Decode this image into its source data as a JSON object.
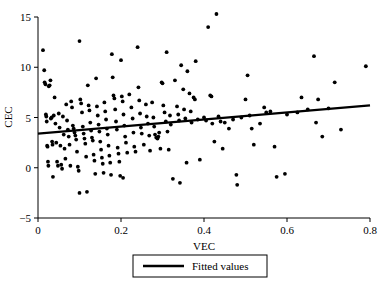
{
  "chart_data": {
    "type": "scatter",
    "title": "",
    "xlabel": "VEC",
    "ylabel": "CEC",
    "xlim": [
      0.0,
      0.8
    ],
    "ylim": [
      -5,
      15
    ],
    "xticks": [
      0,
      0.2,
      0.4,
      0.6,
      0.8
    ],
    "xtick_labels": [
      "0",
      "0.2",
      "0.4",
      "0.6",
      "0.8"
    ],
    "yticks": [
      -5,
      0,
      5,
      10,
      15
    ],
    "ytick_labels": [
      "−5",
      "0",
      "5",
      "10",
      "15"
    ],
    "grid": false,
    "legend_position": "below-axis-center",
    "legend_entries": [
      {
        "label": "Fitted values",
        "type": "line",
        "color": "#000000"
      }
    ],
    "series": [
      {
        "name": "CEC vs VEC observations",
        "type": "scatter",
        "marker": "circle",
        "color": "#000000",
        "points": [
          [
            0.012,
            11.7
          ],
          [
            0.015,
            9.7
          ],
          [
            0.016,
            8.5
          ],
          [
            0.018,
            8.3
          ],
          [
            0.019,
            5.3
          ],
          [
            0.02,
            5.1
          ],
          [
            0.021,
            4.6
          ],
          [
            0.022,
            2.2
          ],
          [
            0.023,
            2.1
          ],
          [
            0.024,
            0.6
          ],
          [
            0.025,
            0.2
          ],
          [
            0.026,
            8.1
          ],
          [
            0.028,
            8.2
          ],
          [
            0.03,
            8.7
          ],
          [
            0.031,
            4.9
          ],
          [
            0.033,
            5.0
          ],
          [
            0.034,
            2.6
          ],
          [
            0.035,
            2.3
          ],
          [
            0.036,
            -0.9
          ],
          [
            0.038,
            5.2
          ],
          [
            0.04,
            7.0
          ],
          [
            0.042,
            4.4
          ],
          [
            0.044,
            2.5
          ],
          [
            0.046,
            0.6
          ],
          [
            0.048,
            0.2
          ],
          [
            0.05,
            5.4
          ],
          [
            0.052,
            4.0
          ],
          [
            0.054,
            2.2
          ],
          [
            0.056,
            0.3
          ],
          [
            0.058,
            -0.1
          ],
          [
            0.06,
            5.1
          ],
          [
            0.062,
            3.3
          ],
          [
            0.064,
            1.9
          ],
          [
            0.066,
            0.9
          ],
          [
            0.068,
            6.3
          ],
          [
            0.07,
            4.7
          ],
          [
            0.072,
            3.8
          ],
          [
            0.074,
            3.1
          ],
          [
            0.076,
            2.3
          ],
          [
            0.078,
            0.2
          ],
          [
            0.08,
            6.6
          ],
          [
            0.082,
            6.0
          ],
          [
            0.084,
            4.2
          ],
          [
            0.086,
            3.9
          ],
          [
            0.088,
            3.5
          ],
          [
            0.09,
            3.2
          ],
          [
            0.092,
            2.8
          ],
          [
            0.094,
            1.6
          ],
          [
            0.096,
            0.1
          ],
          [
            0.098,
            -0.3
          ],
          [
            0.1,
            12.6
          ],
          [
            0.102,
            6.8
          ],
          [
            0.104,
            6.4
          ],
          [
            0.106,
            5.5
          ],
          [
            0.108,
            4.1
          ],
          [
            0.11,
            3.4
          ],
          [
            0.112,
            2.9
          ],
          [
            0.114,
            2.4
          ],
          [
            0.116,
            1.1
          ],
          [
            0.118,
            -2.4
          ],
          [
            0.1,
            -2.5
          ],
          [
            0.12,
            8.2
          ],
          [
            0.122,
            6.2
          ],
          [
            0.124,
            5.7
          ],
          [
            0.126,
            4.5
          ],
          [
            0.128,
            3.7
          ],
          [
            0.13,
            3.0
          ],
          [
            0.132,
            2.7
          ],
          [
            0.134,
            1.3
          ],
          [
            0.136,
            0.7
          ],
          [
            0.138,
            -0.6
          ],
          [
            0.14,
            8.9
          ],
          [
            0.142,
            6.1
          ],
          [
            0.144,
            5.2
          ],
          [
            0.146,
            4.3
          ],
          [
            0.148,
            3.6
          ],
          [
            0.15,
            2.6
          ],
          [
            0.152,
            1.8
          ],
          [
            0.154,
            1.0
          ],
          [
            0.156,
            0.4
          ],
          [
            0.158,
            -0.5
          ],
          [
            0.16,
            6.5
          ],
          [
            0.162,
            5.6
          ],
          [
            0.164,
            4.8
          ],
          [
            0.166,
            3.9
          ],
          [
            0.168,
            3.3
          ],
          [
            0.17,
            2.2
          ],
          [
            0.172,
            1.2
          ],
          [
            0.174,
            0.5
          ],
          [
            0.176,
            -0.7
          ],
          [
            0.178,
            11.3
          ],
          [
            0.18,
            9.0
          ],
          [
            0.182,
            7.2
          ],
          [
            0.184,
            6.9
          ],
          [
            0.186,
            5.8
          ],
          [
            0.188,
            4.6
          ],
          [
            0.19,
            3.8
          ],
          [
            0.192,
            2.0
          ],
          [
            0.194,
            1.4
          ],
          [
            0.196,
            0.6
          ],
          [
            0.198,
            -0.8
          ],
          [
            0.2,
            10.7
          ],
          [
            0.202,
            7.1
          ],
          [
            0.204,
            6.6
          ],
          [
            0.206,
            5.3
          ],
          [
            0.208,
            4.2
          ],
          [
            0.21,
            3.1
          ],
          [
            0.212,
            2.5
          ],
          [
            0.205,
            -1.0
          ],
          [
            0.215,
            1.5
          ],
          [
            0.22,
            7.3
          ],
          [
            0.225,
            6.0
          ],
          [
            0.228,
            4.9
          ],
          [
            0.23,
            3.5
          ],
          [
            0.232,
            2.1
          ],
          [
            0.235,
            1.6
          ],
          [
            0.24,
            12.0
          ],
          [
            0.242,
            8.0
          ],
          [
            0.244,
            6.7
          ],
          [
            0.246,
            5.4
          ],
          [
            0.248,
            4.0
          ],
          [
            0.25,
            3.4
          ],
          [
            0.255,
            2.3
          ],
          [
            0.26,
            6.3
          ],
          [
            0.262,
            5.1
          ],
          [
            0.265,
            4.4
          ],
          [
            0.268,
            3.2
          ],
          [
            0.27,
            1.7
          ],
          [
            0.275,
            6.5
          ],
          [
            0.278,
            5.0
          ],
          [
            0.28,
            4.1
          ],
          [
            0.282,
            3.3
          ],
          [
            0.285,
            3.0
          ],
          [
            0.288,
            2.9
          ],
          [
            0.29,
            3.1
          ],
          [
            0.292,
            3.5
          ],
          [
            0.295,
            1.9
          ],
          [
            0.298,
            8.5
          ],
          [
            0.3,
            8.4
          ],
          [
            0.302,
            6.2
          ],
          [
            0.305,
            5.5
          ],
          [
            0.308,
            4.6
          ],
          [
            0.31,
            11.5
          ],
          [
            0.312,
            3.6
          ],
          [
            0.315,
            1.8
          ],
          [
            0.318,
            5.2
          ],
          [
            0.32,
            4.3
          ],
          [
            0.325,
            -1.1
          ],
          [
            0.33,
            8.7
          ],
          [
            0.335,
            6.1
          ],
          [
            0.338,
            5.3
          ],
          [
            0.34,
            4.7
          ],
          [
            0.342,
            -1.5
          ],
          [
            0.345,
            10.2
          ],
          [
            0.35,
            7.8
          ],
          [
            0.352,
            5.8
          ],
          [
            0.355,
            4.9
          ],
          [
            0.358,
            0.5
          ],
          [
            0.36,
            9.6
          ],
          [
            0.365,
            7.4
          ],
          [
            0.368,
            5.6
          ],
          [
            0.37,
            4.5
          ],
          [
            0.375,
            7.0
          ],
          [
            0.378,
            6.8
          ],
          [
            0.38,
            10.6
          ],
          [
            0.385,
            4.8
          ],
          [
            0.39,
            0.8
          ],
          [
            0.4,
            5.0
          ],
          [
            0.405,
            4.7
          ],
          [
            0.41,
            14.0
          ],
          [
            0.415,
            7.2
          ],
          [
            0.418,
            7.1
          ],
          [
            0.42,
            4.4
          ],
          [
            0.425,
            2.6
          ],
          [
            0.43,
            15.3
          ],
          [
            0.435,
            5.1
          ],
          [
            0.44,
            4.6
          ],
          [
            0.445,
            1.9
          ],
          [
            0.45,
            4.5
          ],
          [
            0.46,
            3.9
          ],
          [
            0.47,
            4.8
          ],
          [
            0.478,
            -0.7
          ],
          [
            0.48,
            -1.7
          ],
          [
            0.49,
            5.0
          ],
          [
            0.5,
            6.8
          ],
          [
            0.505,
            9.2
          ],
          [
            0.51,
            5.2
          ],
          [
            0.515,
            3.9
          ],
          [
            0.52,
            2.3
          ],
          [
            0.535,
            4.4
          ],
          [
            0.545,
            6.0
          ],
          [
            0.55,
            5.5
          ],
          [
            0.56,
            5.6
          ],
          [
            0.57,
            2.1
          ],
          [
            0.575,
            -0.9
          ],
          [
            0.595,
            -0.6
          ],
          [
            0.6,
            5.3
          ],
          [
            0.625,
            5.5
          ],
          [
            0.635,
            7.0
          ],
          [
            0.65,
            5.8
          ],
          [
            0.665,
            11.1
          ],
          [
            0.67,
            4.5
          ],
          [
            0.675,
            6.8
          ],
          [
            0.685,
            3.1
          ],
          [
            0.7,
            5.9
          ],
          [
            0.715,
            8.5
          ],
          [
            0.73,
            3.8
          ],
          [
            0.79,
            10.1
          ]
        ]
      }
    ],
    "fit_line": {
      "name": "Fitted values",
      "type": "line",
      "color": "#000000",
      "x_start": 0.0,
      "y_start": 3.4,
      "x_end": 0.8,
      "y_end": 6.2
    }
  }
}
